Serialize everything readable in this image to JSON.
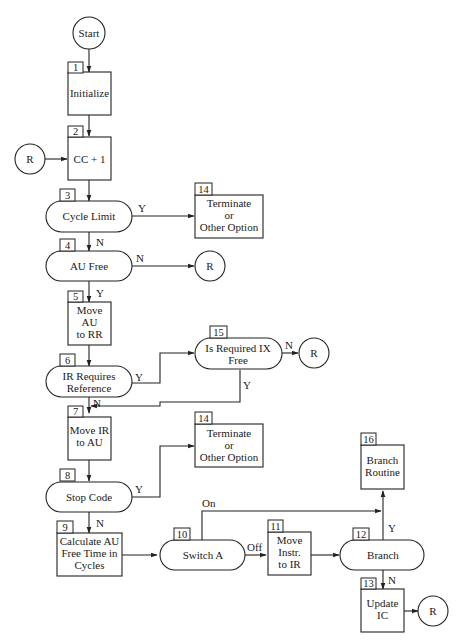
{
  "diagram": {
    "type": "flowchart",
    "nodes": [
      {
        "id": "start",
        "shape": "circle",
        "label": [
          "Start"
        ]
      },
      {
        "id": "n1",
        "number": "1",
        "shape": "process",
        "label": [
          "Initialize"
        ]
      },
      {
        "id": "r_in",
        "shape": "connector",
        "label": [
          "R"
        ]
      },
      {
        "id": "n2",
        "number": "2",
        "shape": "process",
        "label": [
          "CC + 1"
        ]
      },
      {
        "id": "n3",
        "number": "3",
        "shape": "decision",
        "label": [
          "Cycle Limit"
        ]
      },
      {
        "id": "n14a",
        "number": "14",
        "shape": "process",
        "label": [
          "Terminate",
          "or",
          "Other Option"
        ]
      },
      {
        "id": "n4",
        "number": "4",
        "shape": "decision",
        "label": [
          "AU Free"
        ]
      },
      {
        "id": "r_4",
        "shape": "connector",
        "label": [
          "R"
        ]
      },
      {
        "id": "n5",
        "number": "5",
        "shape": "process",
        "label": [
          "Move",
          "AU",
          "to RR"
        ]
      },
      {
        "id": "n6",
        "number": "6",
        "shape": "decision",
        "label": [
          "IR Requires",
          "Reference"
        ]
      },
      {
        "id": "n15",
        "number": "15",
        "shape": "decision",
        "label": [
          "Is Required IX",
          "Free"
        ]
      },
      {
        "id": "r_15",
        "shape": "connector",
        "label": [
          "R"
        ]
      },
      {
        "id": "n7",
        "number": "7",
        "shape": "process",
        "label": [
          "Move IR",
          "to AU"
        ]
      },
      {
        "id": "n14b",
        "number": "14",
        "shape": "process",
        "label": [
          "Terminate",
          "or",
          "Other Option"
        ]
      },
      {
        "id": "n8",
        "number": "8",
        "shape": "decision",
        "label": [
          "Stop Code"
        ]
      },
      {
        "id": "n9",
        "number": "9",
        "shape": "process",
        "label": [
          "Calculate AU",
          "Free Time in",
          "Cycles"
        ]
      },
      {
        "id": "n10",
        "number": "10",
        "shape": "decision",
        "label": [
          "Switch A"
        ]
      },
      {
        "id": "n11",
        "number": "11",
        "shape": "process",
        "label": [
          "Move",
          "Instr.",
          "to IR"
        ]
      },
      {
        "id": "n12",
        "number": "12",
        "shape": "decision",
        "label": [
          "Branch"
        ]
      },
      {
        "id": "n16",
        "number": "16",
        "shape": "process",
        "label": [
          "Branch",
          "Routine"
        ]
      },
      {
        "id": "n13",
        "number": "13",
        "shape": "process",
        "label": [
          "Update",
          "IC"
        ]
      },
      {
        "id": "r_13",
        "shape": "connector",
        "label": [
          "R"
        ]
      }
    ],
    "edge_labels": {
      "n3_y": "Y",
      "n3_n": "N",
      "n4_n": "N",
      "n4_y": "Y",
      "n6_y": "Y",
      "n6_n": "N",
      "n15_n": "N",
      "n15_y": "Y",
      "n8_y": "Y",
      "n8_n": "N",
      "n10_on": "On",
      "n10_off": "Off",
      "n12_y": "Y",
      "n12_n": "N"
    },
    "edges": [
      {
        "from": "start",
        "to": "n1"
      },
      {
        "from": "n1",
        "to": "n2"
      },
      {
        "from": "r_in",
        "to": "n2"
      },
      {
        "from": "n2",
        "to": "n3"
      },
      {
        "from": "n3",
        "to": "n14a",
        "label": "Y"
      },
      {
        "from": "n3",
        "to": "n4",
        "label": "N"
      },
      {
        "from": "n4",
        "to": "r_4",
        "label": "N"
      },
      {
        "from": "n4",
        "to": "n5",
        "label": "Y"
      },
      {
        "from": "n5",
        "to": "n6"
      },
      {
        "from": "n6",
        "to": "n15",
        "label": "Y"
      },
      {
        "from": "n6",
        "to": "n7",
        "label": "N"
      },
      {
        "from": "n15",
        "to": "r_15",
        "label": "N"
      },
      {
        "from": "n15",
        "to": "n7",
        "label": "Y"
      },
      {
        "from": "n7",
        "to": "n8"
      },
      {
        "from": "n8",
        "to": "n14b",
        "label": "Y"
      },
      {
        "from": "n8",
        "to": "n9",
        "label": "N"
      },
      {
        "from": "n9",
        "to": "n10"
      },
      {
        "from": "n10",
        "to": "n16",
        "label": "On"
      },
      {
        "from": "n10",
        "to": "n11",
        "label": "Off"
      },
      {
        "from": "n11",
        "to": "n12"
      },
      {
        "from": "n12",
        "to": "n16",
        "label": "Y"
      },
      {
        "from": "n12",
        "to": "n13",
        "label": "N"
      },
      {
        "from": "n13",
        "to": "r_13"
      }
    ]
  }
}
